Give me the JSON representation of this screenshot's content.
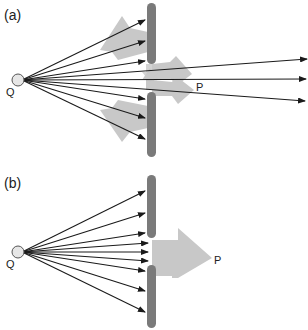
{
  "panels": [
    {
      "id": "a",
      "label": "(a)",
      "source_label": "Q",
      "target_label": "P",
      "description": "Wavelets from source Q pass a barrier with a gap; reflected wavelets spread back and diffracted wavelets spread out past the gap"
    },
    {
      "id": "b",
      "label": "(b)",
      "source_label": "Q",
      "target_label": "P",
      "description": "Rays from source Q hit barrier; through the gap a single broad arrow propagates toward P"
    }
  ],
  "colors": {
    "wall": "#7a7a7a",
    "wave_arrow": "#c8c8c8",
    "ray": "#1a1a1a",
    "source_fill": "#e6e6e6",
    "source_stroke": "#555555"
  }
}
